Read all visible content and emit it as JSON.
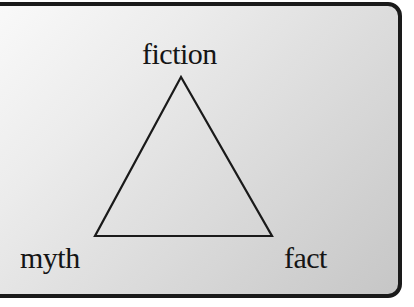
{
  "diagram": {
    "type": "triangle",
    "vertices": {
      "top": {
        "label": "fiction",
        "x": 181,
        "y": 77
      },
      "bottom_left": {
        "label": "myth",
        "x": 95,
        "y": 236
      },
      "bottom_right": {
        "label": "fact",
        "x": 272,
        "y": 236
      }
    },
    "labels": {
      "top": "fiction",
      "bottom_left": "myth",
      "bottom_right": "fact"
    },
    "colors": {
      "stroke": "#1a1a1a",
      "text": "#151515",
      "background_light": "#fafafa",
      "background_dark": "#c6c6c6",
      "border": "#1a1a1a"
    }
  }
}
